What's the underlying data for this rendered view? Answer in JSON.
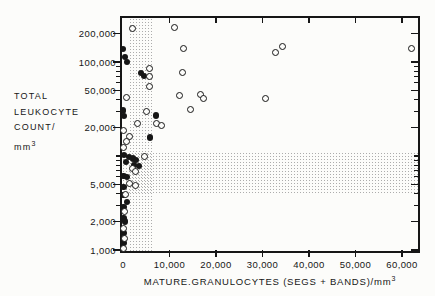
{
  "figure": {
    "y_axis": {
      "title_lines": [
        "TOTAL",
        "LEUKOCYTE",
        "COUNT/"
      ],
      "title_unit": "mm",
      "title_unit_sup": "3",
      "tick_labels": [
        "200,000",
        "100,000",
        "50,000",
        "20,000",
        "5,000",
        "2,000",
        "1,000"
      ]
    },
    "x_axis": {
      "title": "MATURE.GRANULOCYTES (SEGS + BANDS)/mm",
      "title_sup": "3",
      "tick_labels": [
        "0",
        "10,000",
        "20,000",
        "30,000",
        "40,000",
        "50,000",
        "60,000"
      ]
    },
    "colors": {
      "ink": "#161616",
      "stipple_dots": "#9e9e9e",
      "paper": "#fcfcfa"
    }
  },
  "chart_data": {
    "type": "scatter",
    "title": "",
    "xlabel": "MATURE GRANULOCYTES (SEGS + BANDS)/mm3",
    "ylabel": "TOTAL LEUKOCYTE COUNT/mm3",
    "x_scale": "linear",
    "y_scale": "log",
    "x_range": [
      0,
      63500
    ],
    "y_range": [
      1000,
      300000
    ],
    "x_major_ticks": [
      10000,
      20000,
      30000,
      40000,
      50000,
      60000
    ],
    "x_labeled_values": [
      0,
      10000,
      20000,
      30000,
      40000,
      50000,
      60000
    ],
    "y_labeled_ticks": [
      200000,
      100000,
      50000,
      20000,
      5000,
      2000,
      1000
    ],
    "y_minor_ticks": [
      3000,
      4000,
      6000,
      7000,
      8000,
      9000,
      10000,
      30000,
      40000,
      60000,
      70000,
      80000,
      90000
    ],
    "grid": false,
    "legend": null,
    "normal_range_bands": {
      "x_band_granulocytes": [
        1100,
        6100
      ],
      "y_band_leukocytes": [
        4000,
        11000
      ]
    },
    "series": [
      {
        "name": "filled-circles",
        "marker": "filled-circle",
        "points": [
          [
            0,
            137000
          ],
          [
            400,
            113000
          ],
          [
            900,
            100000
          ],
          [
            3900,
            76000
          ],
          [
            4500,
            71000
          ],
          [
            0,
            30500
          ],
          [
            200,
            26500
          ],
          [
            7100,
            27000
          ],
          [
            5800,
            15800
          ],
          [
            250,
            10200
          ],
          [
            1300,
            9700
          ],
          [
            2100,
            9400
          ],
          [
            2800,
            9100
          ],
          [
            650,
            8600
          ],
          [
            2400,
            8000
          ],
          [
            3450,
            7800
          ],
          [
            150,
            6100
          ],
          [
            900,
            6000
          ],
          [
            100,
            4700
          ],
          [
            100,
            3850
          ],
          [
            900,
            3250
          ],
          [
            150,
            2850
          ],
          [
            100,
            2200
          ],
          [
            450,
            2000
          ],
          [
            100,
            1520
          ],
          [
            100,
            1190
          ]
        ]
      },
      {
        "name": "open-circles",
        "marker": "open-circle",
        "points": [
          [
            2100,
            225000
          ],
          [
            5600,
            86000
          ],
          [
            5600,
            70000
          ],
          [
            5600,
            55000
          ],
          [
            11000,
            230000
          ],
          [
            13000,
            140000
          ],
          [
            12700,
            78000
          ],
          [
            12200,
            43500
          ],
          [
            16600,
            45000
          ],
          [
            17400,
            41000
          ],
          [
            14600,
            31500
          ],
          [
            32700,
            125000
          ],
          [
            34400,
            145000
          ],
          [
            62000,
            140000
          ],
          [
            30700,
            40500
          ],
          [
            850,
            41500
          ],
          [
            4950,
            29500
          ],
          [
            7300,
            22400
          ],
          [
            8200,
            21000
          ],
          [
            3200,
            22000
          ],
          [
            0,
            18900
          ],
          [
            1500,
            16300
          ],
          [
            650,
            14100
          ],
          [
            4700,
            10000
          ],
          [
            1950,
            7300
          ],
          [
            2600,
            6800
          ],
          [
            0,
            12400
          ],
          [
            1500,
            5150
          ],
          [
            2600,
            4900
          ],
          [
            450,
            3850
          ],
          [
            250,
            2550
          ],
          [
            0,
            1700
          ],
          [
            250,
            1340
          ],
          [
            150,
            1050
          ]
        ]
      }
    ]
  }
}
